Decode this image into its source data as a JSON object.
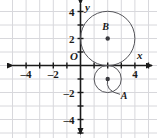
{
  "chart_data": {
    "type": "scatter",
    "title": "",
    "xlabel": "x",
    "ylabel": "y",
    "origin_label": "O",
    "xlim": [
      -5,
      5.5
    ],
    "ylim": [
      -5,
      5
    ],
    "grid": true,
    "grid_color": "#d8d8dc",
    "axis_color": "#1a1a1a",
    "curve_color": "#55555a",
    "background": "#ffffff",
    "x_ticks": [
      -4,
      -2,
      4
    ],
    "x_tick_labels": [
      "–4",
      "–2",
      "4"
    ],
    "y_ticks": [
      4,
      2,
      -2,
      -4
    ],
    "y_tick_labels": [
      "4",
      "2",
      "–2",
      "–4"
    ],
    "circles": [
      {
        "name": "B",
        "label": "B",
        "center": [
          2,
          2
        ],
        "radius": 2,
        "center_marked": true,
        "label_offset": [
          -0.15,
          0.6
        ],
        "leader": false
      },
      {
        "name": "A",
        "label": "A",
        "center": [
          2,
          -1
        ],
        "radius": 1,
        "center_marked": true,
        "label_offset": [
          1.2,
          -1.5
        ],
        "leader": true
      }
    ],
    "annotations": []
  },
  "figure": {
    "alt": "Coordinate plane with two tangent circles: circle B centered at (2, 2) radius 2, and circle A centered at (2, -1) radius 1"
  }
}
